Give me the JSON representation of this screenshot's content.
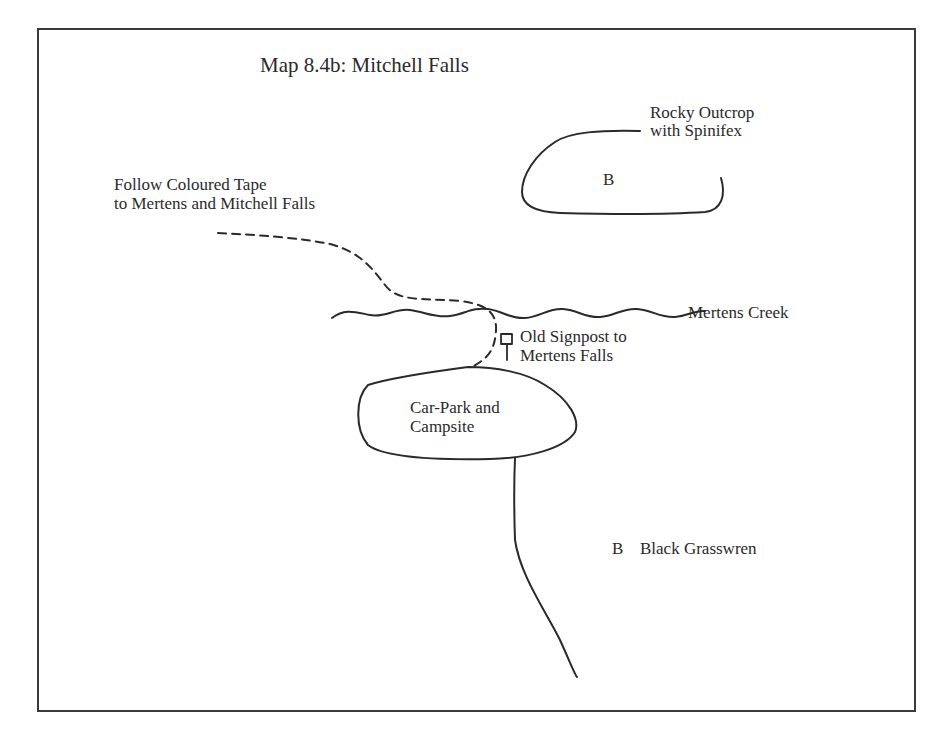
{
  "map": {
    "title": "Map 8.4b:  Mitchell Falls",
    "labels": {
      "rocky_outcrop": [
        "Rocky Outcrop",
        "with Spinifex"
      ],
      "outcrop_marker": "B",
      "follow_tape": [
        "Follow Coloured Tape",
        "to Mertens and Mitchell Falls"
      ],
      "creek": "Mertens Creek",
      "signpost": [
        "Old Signpost to",
        "Mertens Falls"
      ],
      "carpark": [
        "Car-Park and",
        "Campsite"
      ],
      "legend_marker": "B",
      "legend_text": "Black Grasswren"
    },
    "colors": {
      "ink": "#2a2a2a",
      "border": "#3a3a3a",
      "background": "#ffffff"
    }
  }
}
